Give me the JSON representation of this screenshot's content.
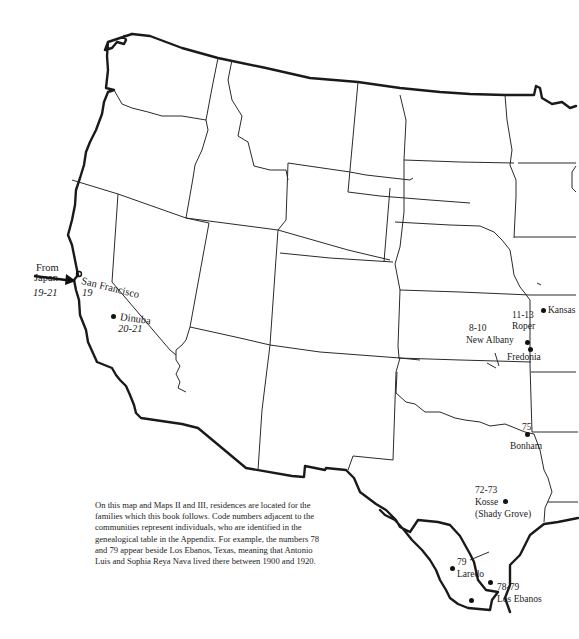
{
  "map": {
    "type": "outline map of western and central United States",
    "places": [
      {
        "name": "San Francisco",
        "codes": "19"
      },
      {
        "name": "Dinuba",
        "codes": "20-21"
      },
      {
        "name": "Kansas",
        "codes": "11-13"
      },
      {
        "name": "Roper",
        "codes": ""
      },
      {
        "name": "New Albany",
        "codes": "8-10"
      },
      {
        "name": "Fredonia",
        "codes": ""
      },
      {
        "name": "Bonham",
        "codes": "75"
      },
      {
        "name": "Kosse (Shady Grove)",
        "codes": "72-73"
      },
      {
        "name": "Laredo",
        "codes": "79"
      },
      {
        "name": "Los Ebanos",
        "codes": "78-79"
      }
    ],
    "arrow": {
      "label_line1": "From",
      "label_line2": "Japan",
      "codes": "19-21"
    }
  },
  "labels": {
    "from": "From",
    "japan": "Japan",
    "japan_codes": "19-21",
    "san_francisco": "San Francisco",
    "san_francisco_codes": "19",
    "dinuba": "Dinuba",
    "dinuba_codes": "20-21",
    "kansas_codes": "11-13",
    "kansas": "Kansas",
    "roper": "Roper",
    "new_albany_codes": "8-10",
    "new_albany": "New Albany",
    "fredonia": "Fredonia",
    "bonham_codes": "75",
    "bonham": "Bonham",
    "kosse_codes": "72-73",
    "kosse": "Kosse",
    "shady_grove": "(Shady Grove)",
    "laredo_codes": "79",
    "laredo": "Laredo",
    "los_ebanos_codes": "78-79",
    "los_ebanos": "Los Ebanos"
  },
  "caption": "On this map and Maps II and III, residences are located for the families which this book follows.  Code numbers adjacent to the communities represent individuals, who are identified in the genealogical table in the Appendix. For example, the numbers 78 and 79 appear beside Los Ebanos, Texas, meaning that Antonio Luis and Sophia Reya Nava lived there between 1900 and 1920."
}
